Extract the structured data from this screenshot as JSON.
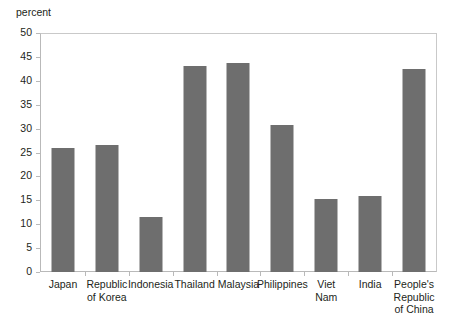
{
  "chart_data": {
    "type": "bar",
    "title": "",
    "subtitle": "",
    "xlabel": "",
    "ylabel": "percent",
    "unit_label": "percent",
    "ylim": [
      0,
      50
    ],
    "ytick_step": 5,
    "yticks": [
      50,
      45,
      40,
      35,
      30,
      25,
      20,
      15,
      10,
      5,
      0
    ],
    "grid": false,
    "legend": false,
    "legend_position": "none",
    "bar_color": "#6e6e6e",
    "axis_color": "#b9b9b9",
    "background_color": "#ffffff",
    "text_color": "#231f20",
    "categories": [
      "Japan",
      "Republic of Korea",
      "Indonesia",
      "Thailand",
      "Malaysia",
      "Philippines",
      "Viet Nam",
      "India",
      "People's Republic of China"
    ],
    "category_lines": [
      [
        "Japan"
      ],
      [
        "Republic",
        "of Korea"
      ],
      [
        "Indonesia"
      ],
      [
        "Thailand"
      ],
      [
        "Malaysia"
      ],
      [
        "Philippines"
      ],
      [
        "Viet",
        "Nam"
      ],
      [
        "India"
      ],
      [
        "People's",
        "Republic",
        "of China"
      ]
    ],
    "values": [
      25.9,
      26.5,
      11.5,
      43.2,
      43.8,
      30.8,
      15.3,
      16.0,
      42.4
    ]
  }
}
